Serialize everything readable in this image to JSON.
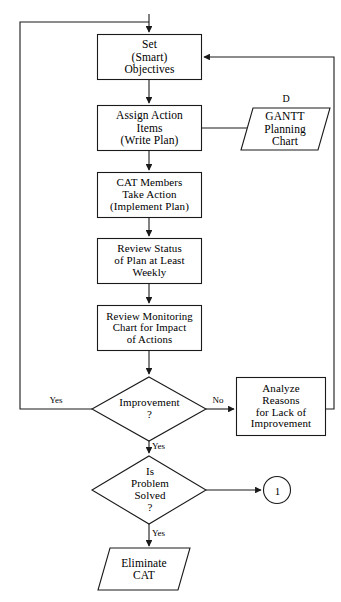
{
  "diagram": {
    "line_color": "#1a1a1a",
    "text_color": "#000000",
    "background_color": "#ffffff"
  },
  "nodes": {
    "set_objectives": {
      "label": "Set\n(Smart)\nObjectives",
      "shape": "process"
    },
    "assign_action_items": {
      "label": "Assign Action\nItems\n(Write Plan)",
      "shape": "process"
    },
    "gantt_chart": {
      "label": "GANTT\nPlanning\nChart",
      "shape": "document",
      "tag": "D"
    },
    "cat_members_take_action": {
      "label": "CAT Members\nTake Action\n(Implement Plan)",
      "shape": "process"
    },
    "review_status": {
      "label": "Review Status\nof Plan at Least\nWeekly",
      "shape": "process"
    },
    "review_monitoring_chart": {
      "label": "Review Monitoring\nChart for Impact\nof Actions",
      "shape": "process"
    },
    "improvement_decision": {
      "label": "Improvement\n?",
      "shape": "decision"
    },
    "analyze_reasons": {
      "label": "Analyze\nReasons\nfor Lack of\nImprovement",
      "shape": "process"
    },
    "problem_solved_decision": {
      "label": "Is\nProblem\nSolved\n?",
      "shape": "decision"
    },
    "offpage_connector_1": {
      "label": "1",
      "shape": "connector"
    },
    "eliminate_cat": {
      "label": "Eliminate\nCAT",
      "shape": "document"
    }
  },
  "edge_labels": {
    "improvement_yes_left": "Yes",
    "improvement_no_right": "No",
    "improvement_yes_down": "Yes",
    "problem_solved_yes_down": "Yes"
  }
}
